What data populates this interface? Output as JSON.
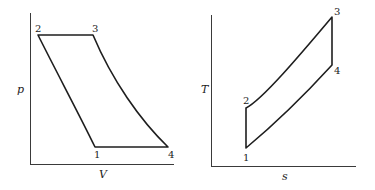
{
  "diagrams": [
    {
      "id": "pv",
      "xlabel": "V",
      "ylabel": "p",
      "points": [
        {
          "label": "1"
        },
        {
          "label": "2"
        },
        {
          "label": "3"
        },
        {
          "label": "4"
        }
      ],
      "processes": [
        "1-2 compression (curve)",
        "2-3 constant pressure",
        "3-4 expansion (curve)",
        "4-1 constant pressure"
      ]
    },
    {
      "id": "ts",
      "xlabel": "s",
      "ylabel": "T",
      "points": [
        {
          "label": "1"
        },
        {
          "label": "2"
        },
        {
          "label": "3"
        },
        {
          "label": "4"
        }
      ],
      "processes": [
        "1-2 isentropic",
        "2-3 heat addition (curve)",
        "3-4 isentropic",
        "4-1 heat rejection (curve)"
      ]
    }
  ]
}
